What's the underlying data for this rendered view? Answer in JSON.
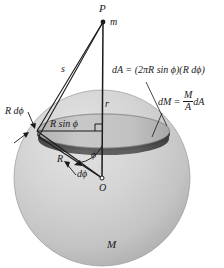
{
  "figure": {
    "colors": {
      "sphere_light": "#d2d2d2",
      "sphere_shadow": "#b8b8b8",
      "ring_band": "#bdbdbd",
      "ring_dark": "#555555",
      "line": "#1a1a1a",
      "text": "#1a1a1a",
      "background": "#ffffff"
    }
  },
  "labels": {
    "point_p": "P",
    "mass_m": "m",
    "distance_s": "s",
    "distance_r": "r",
    "radius_R": "R",
    "ring_radius": "R sin ϕ",
    "arc_element": "R dϕ",
    "angle_phi": "ϕ",
    "angle_dphi": "dϕ",
    "center_O": "O",
    "sphere_mass_M": "M"
  },
  "equations": {
    "area_element": {
      "lhs": "dA",
      "equals": "=",
      "rhs": "(2πR sin ϕ)(R dϕ)",
      "full": "dA = (2πR sin ϕ)(R dϕ)"
    },
    "mass_element": {
      "lhs": "dM",
      "equals": "=",
      "numerator": "M",
      "denominator": "A",
      "tail": "dA",
      "full": "dM = (M/A) dA"
    }
  },
  "geometry": {
    "sphere_center": {
      "x": 102,
      "y": 178
    },
    "sphere_radius": 88,
    "point_p": {
      "x": 103,
      "y": 22
    },
    "ring_left": {
      "x": 37,
      "y": 131
    },
    "ring_right": {
      "x": 170,
      "y": 131
    },
    "ring_front_y": 143,
    "ring_top_y": 119
  }
}
